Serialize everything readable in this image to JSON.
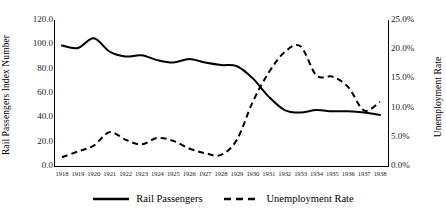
{
  "chart_data": {
    "type": "line",
    "title": "",
    "subtitle": "",
    "xlabel": "",
    "ylabel": "Rail Passengers Index Number",
    "y2label": "Unemployment Rate",
    "grid": false,
    "legend_position": "bottom-center",
    "x": [
      1918,
      1919,
      1920,
      1921,
      1922,
      1923,
      1924,
      1925,
      1926,
      1927,
      1928,
      1929,
      1930,
      1931,
      1932,
      1933,
      1934,
      1935,
      1936,
      1937,
      1938
    ],
    "categories": [
      "1918",
      "1919",
      "1920",
      "1921",
      "1922",
      "1923",
      "1924",
      "1925",
      "1926",
      "1927",
      "1928",
      "1929",
      "1930",
      "1931",
      "1932",
      "1933",
      "1934",
      "1935",
      "1936",
      "1937",
      "1938"
    ],
    "ylim": [
      0,
      120
    ],
    "yticks": [
      0,
      20,
      40,
      60,
      80,
      100,
      120
    ],
    "ytick_labels": [
      "0.0",
      "20.0",
      "40.0",
      "60.0",
      "80.0",
      "100.0",
      "120.0"
    ],
    "y2lim": [
      0,
      0.25
    ],
    "y2ticks": [
      0,
      0.05,
      0.1,
      0.15,
      0.2,
      0.25
    ],
    "y2tick_labels": [
      "0.0%",
      "5.0%",
      "10.0%",
      "15.0%",
      "20.0%",
      "25.0%"
    ],
    "series": [
      {
        "name": "Rail Passengers",
        "axis": "left",
        "style": "solid",
        "color": "#000000",
        "values": [
          99,
          97,
          105,
          94,
          90,
          91,
          87,
          85,
          88,
          85,
          83,
          82,
          72,
          57,
          46,
          44,
          46,
          45,
          45,
          44,
          42
        ]
      },
      {
        "name": "Unemployment Rate",
        "axis": "right",
        "style": "dashed",
        "color": "#000000",
        "values": [
          0.015,
          0.025,
          0.035,
          0.058,
          0.045,
          0.037,
          0.048,
          0.043,
          0.03,
          0.022,
          0.019,
          0.045,
          0.11,
          0.16,
          0.195,
          0.205,
          0.155,
          0.153,
          0.135,
          0.095,
          0.11
        ]
      }
    ]
  },
  "axes": {
    "left_title": "Rail Passengers Index Number",
    "right_title": "Unemployment Rate"
  },
  "legend": {
    "items": [
      {
        "label": "Rail Passengers",
        "style": "solid"
      },
      {
        "label": "Unemployment Rate",
        "style": "dashed"
      }
    ]
  },
  "colors": {
    "line": "#000000",
    "text": "#000000",
    "tick_text": "#222222",
    "background": "#ffffff"
  }
}
